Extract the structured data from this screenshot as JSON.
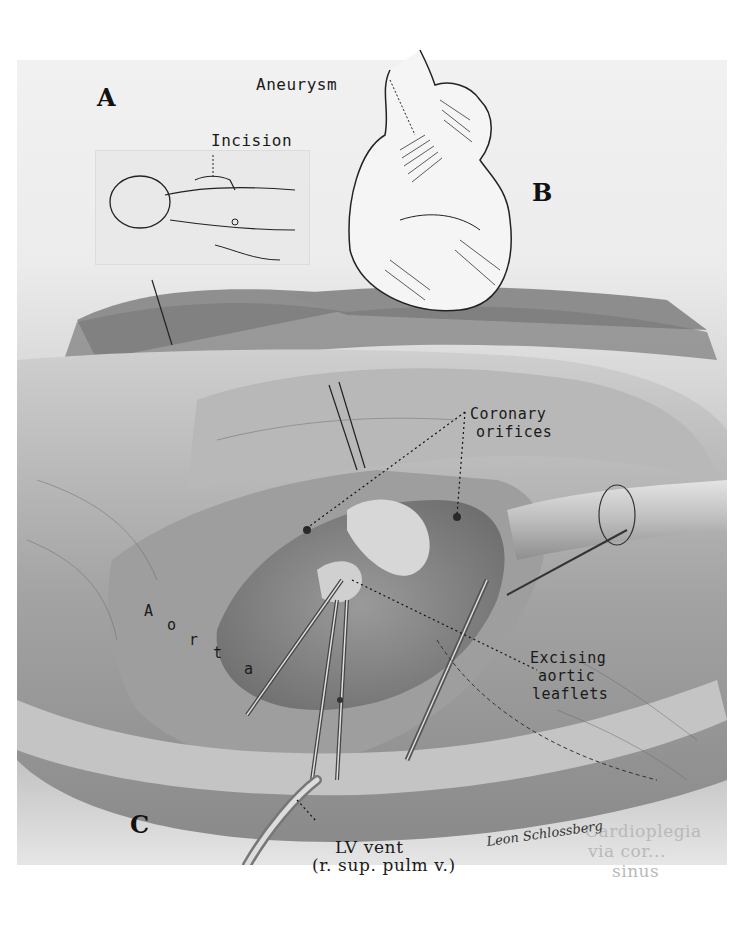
{
  "figure": {
    "panels": [
      {
        "id": "A",
        "label": "A",
        "description": "Patient positioning with incision site"
      },
      {
        "id": "B",
        "label": "B",
        "description": "Heart with ascending aortic aneurysm"
      },
      {
        "id": "C",
        "label": "C",
        "description": "Operative view: excising aortic leaflets"
      }
    ],
    "annotations": {
      "aneurysm": "Aneurysm",
      "incision": "Incision",
      "coronary_orifices_line1": "Coronary",
      "coronary_orifices_line2": "orifices",
      "aorta_letters": [
        "A",
        "o",
        "r",
        "t",
        "a"
      ],
      "excising_line1": "Excising",
      "excising_line2": "aortic",
      "excising_line3": "leaflets",
      "lv_vent_line1": "LV vent",
      "lv_vent_line2": "(r. sup. pulm v.)",
      "cardioplegia_line1": "Cardioplegia",
      "cardioplegia_line2": "via cor...",
      "cardioplegia_line3": "sinus"
    },
    "signature": "Leon Schlossberg",
    "colors": {
      "ink": "#1a1a1a",
      "paper": "#efefef",
      "tissue_mid": "#a8a8a8",
      "tissue_dark": "#6e6e6e",
      "faint_text": "#b9b9b9"
    }
  }
}
